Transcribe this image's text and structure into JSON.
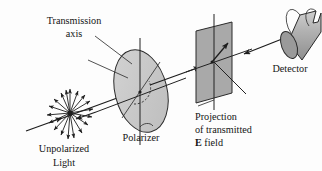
{
  "figure": {
    "name": "polarization-diagram",
    "labels": {
      "transmission_axis_line1": "Transmission",
      "transmission_axis_line2": "axis",
      "unpolarized_line1": "Unpolarized",
      "unpolarized_line2": "Light",
      "polarizer": "Polarizer",
      "projection_line1": "Projection",
      "projection_line2": "of transmitted",
      "projection_line3_bold": "E",
      "projection_line3_rest": " field",
      "detector": "Detector"
    },
    "colors": {
      "ink": "#1a1a1a",
      "polarizer_fill": "#c9c9c9",
      "polarizer_rim": "#b4b4b4",
      "plane_fill": "#a9a9a9",
      "detector_fill": "#b0b0b0",
      "detector_face": "#9a9a9a",
      "background": "#fdfdfd"
    },
    "elements": {
      "burst_ray_count": 18,
      "polarizer_shape": "tilted-disk",
      "plane_shape": "parallelogram",
      "detector_shape": "notched-cylinder"
    }
  }
}
